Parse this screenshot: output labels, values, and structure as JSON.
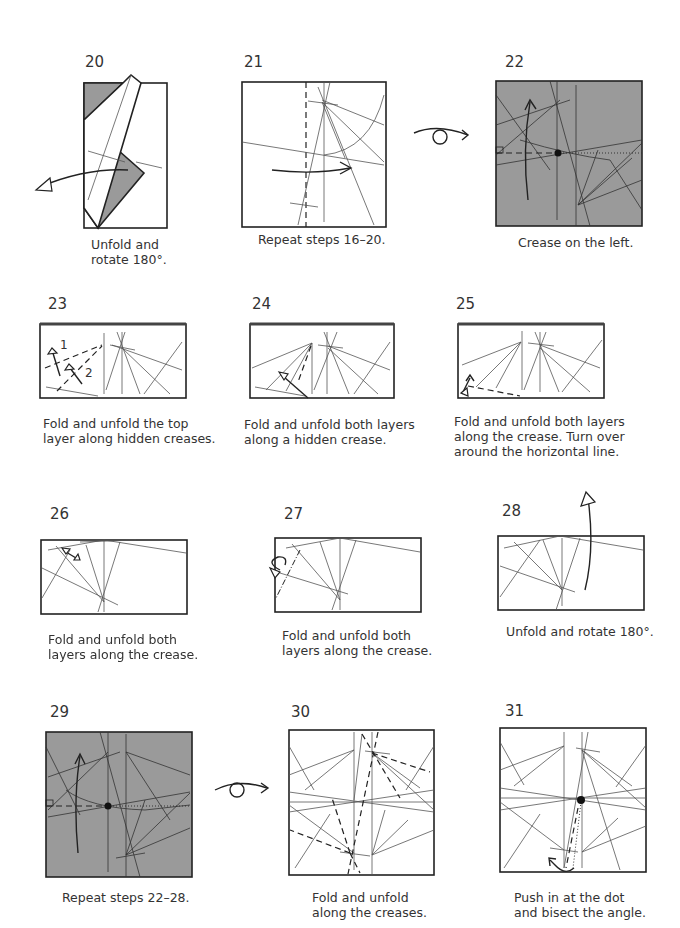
{
  "page": {
    "background": "#ffffff",
    "paper_gray": "#9a9a9a",
    "line_color": "#222222"
  },
  "steps": [
    {
      "number": "20",
      "caption": "Unfold and\nrotate 180°."
    },
    {
      "number": "21",
      "caption": "Repeat steps 16–20."
    },
    {
      "number": "22",
      "caption": "Crease on the left."
    },
    {
      "number": "23",
      "caption": "Fold and unfold the top\nlayer along hidden creases.",
      "labels": [
        "1",
        "2"
      ]
    },
    {
      "number": "24",
      "caption": "Fold and unfold both layers\nalong a hidden crease."
    },
    {
      "number": "25",
      "caption": "Fold and unfold both layers\nalong the crease. Turn over\naround the horizontal line."
    },
    {
      "number": "26",
      "caption": "Fold and unfold both\nlayers along the crease."
    },
    {
      "number": "27",
      "caption": "Fold and unfold both\nlayers along the crease."
    },
    {
      "number": "28",
      "caption": "Unfold and rotate 180°."
    },
    {
      "number": "29",
      "caption": "Repeat steps 22–28."
    },
    {
      "number": "30",
      "caption": "Fold and unfold\nalong the creases."
    },
    {
      "number": "31",
      "caption": "Push in at the dot\nand bisect the angle."
    }
  ],
  "icons": {
    "turn_over_1": "turn-over-icon",
    "turn_over_2": "turn-over-icon",
    "turn_over_vertical": "turn-over-vertical-icon"
  }
}
